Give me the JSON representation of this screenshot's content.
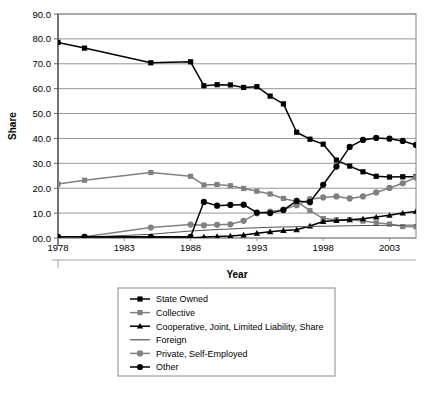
{
  "chart_data": {
    "type": "line",
    "title": "",
    "xlabel": "Year",
    "ylabel": "Share",
    "xlim": [
      1978,
      2005
    ],
    "ylim": [
      0,
      90
    ],
    "ytick_labels": [
      "90.0",
      "80.0",
      "70.0",
      "60.0",
      "50.0",
      "40.0",
      "30.0",
      "20.0",
      "10.0",
      "00.0"
    ],
    "ytick_values": [
      90,
      80,
      70,
      60,
      50,
      40,
      30,
      20,
      10,
      0
    ],
    "xtick_labels": [
      "1978",
      "1983",
      "1988",
      "1993",
      "1998",
      "2003"
    ],
    "xtick_values": [
      1978,
      1983,
      1988,
      1993,
      1998,
      2003
    ],
    "grid": "horizontal",
    "legend_position": "below",
    "series": [
      {
        "name": "State Owned",
        "marker": "square",
        "color": "#000000",
        "x": [
          1978,
          1980,
          1985,
          1988,
          1989,
          1990,
          1991,
          1992,
          1993,
          1994,
          1995,
          1996,
          1997,
          1998,
          1999,
          2000,
          2001,
          2002,
          2003,
          2004,
          2005
        ],
        "values": [
          78.6,
          76.3,
          70.4,
          70.8,
          61.2,
          61.6,
          61.5,
          60.5,
          60.8,
          57.0,
          53.9,
          42.5,
          39.7,
          37.7,
          31.3,
          28.9,
          26.6,
          24.8,
          24.5,
          24.6,
          24.6
        ]
      },
      {
        "name": "Collective",
        "marker": "square",
        "color": "#808080",
        "x": [
          1978,
          1980,
          1985,
          1988,
          1989,
          1990,
          1991,
          1992,
          1993,
          1994,
          1995,
          1996,
          1997,
          1998,
          1999,
          2000,
          2001,
          2002,
          2003,
          2004,
          2005
        ],
        "values": [
          21.7,
          23.2,
          26.3,
          24.8,
          21.3,
          21.5,
          21.0,
          19.9,
          18.8,
          17.7,
          15.9,
          14.7,
          11.0,
          7.8,
          7.3,
          7.4,
          6.8,
          6.1,
          5.6,
          4.6,
          4.5
        ]
      },
      {
        "name": "Cooperative, Joint, Limited Liability, Share",
        "marker": "triangle",
        "color": "#000000",
        "x": [
          1978,
          1980,
          1985,
          1988,
          1989,
          1990,
          1991,
          1992,
          1993,
          1994,
          1995,
          1996,
          1997,
          1998,
          1999,
          2000,
          2001,
          2002,
          2003,
          2004,
          2005
        ],
        "values": [
          0.0,
          0.0,
          0.0,
          0.0,
          0.4,
          0.6,
          0.8,
          1.2,
          1.9,
          2.5,
          3.0,
          3.3,
          4.8,
          6.6,
          7.0,
          7.3,
          7.7,
          8.4,
          9.1,
          10.0,
          10.7
        ]
      },
      {
        "name": "Foreign",
        "marker": "none",
        "color": "#555555",
        "x": [
          1978,
          1980,
          1985,
          1988,
          1989,
          1990,
          1991,
          1992,
          1993,
          1994,
          1995,
          1996,
          1997,
          1998,
          1999,
          2000,
          2001,
          2002,
          2003,
          2004,
          2005
        ],
        "values": [
          0.0,
          0.3,
          1.5,
          2.8,
          3.1,
          3.4,
          3.6,
          3.9,
          4.1,
          4.3,
          4.4,
          4.5,
          4.6,
          4.7,
          4.8,
          4.9,
          5.0,
          5.0,
          5.1,
          5.1,
          5.2
        ]
      },
      {
        "name": "Private, Self-Employed",
        "marker": "circle",
        "color": "#808080",
        "x": [
          1978,
          1980,
          1985,
          1988,
          1989,
          1990,
          1991,
          1992,
          1993,
          1994,
          1995,
          1996,
          1997,
          1998,
          1999,
          2000,
          2001,
          2002,
          2003,
          2004,
          2005
        ],
        "values": [
          0.2,
          0.5,
          4.2,
          5.4,
          5.1,
          5.3,
          5.5,
          6.9,
          9.9,
          10.6,
          11.4,
          13.2,
          15.6,
          16.3,
          16.7,
          15.9,
          16.7,
          18.3,
          20.1,
          22.0,
          24.3
        ]
      },
      {
        "name": "Other",
        "marker": "circle",
        "color": "#000000",
        "x": [
          1978,
          1980,
          1985,
          1988,
          1989,
          1990,
          1991,
          1992,
          1993,
          1994,
          1995,
          1996,
          1997,
          1998,
          1999,
          2000,
          2001,
          2002,
          2003,
          2004,
          2005
        ],
        "values": [
          0.5,
          0.5,
          0.5,
          0.5,
          14.5,
          13.0,
          13.3,
          13.4,
          10.2,
          10.0,
          11.2,
          14.9,
          14.4,
          21.4,
          28.7,
          36.6,
          39.4,
          40.2,
          39.9,
          39.0,
          37.4
        ]
      }
    ]
  },
  "caption": "",
  "legend": {
    "items": [
      {
        "label": "State Owned"
      },
      {
        "label": "Collective"
      },
      {
        "label": "Cooperative, Joint, Limited Liability, Share"
      },
      {
        "label": "Foreign"
      },
      {
        "label": "Private, Self-Employed"
      },
      {
        "label": "Other"
      }
    ]
  }
}
